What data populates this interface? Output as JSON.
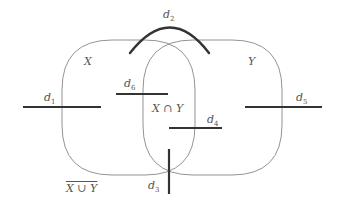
{
  "diagram": {
    "type": "venn-with-decision-segments",
    "sets": [
      {
        "id": "X",
        "label": "X"
      },
      {
        "id": "Y",
        "label": "Y"
      }
    ],
    "regions": {
      "intersection": "X ∩ Y",
      "complement": "X ∪ Y"
    },
    "segments": [
      {
        "id": "d1",
        "label": "d",
        "sub": "1"
      },
      {
        "id": "d2",
        "label": "d",
        "sub": "2"
      },
      {
        "id": "d3",
        "label": "d",
        "sub": "3"
      },
      {
        "id": "d4",
        "label": "d",
        "sub": "4"
      },
      {
        "id": "d5",
        "label": "d",
        "sub": "5"
      },
      {
        "id": "d6",
        "label": "d",
        "sub": "6"
      }
    ],
    "colors": {
      "set_outline": "#777777",
      "segment": "#333333",
      "label": "#555555"
    }
  }
}
